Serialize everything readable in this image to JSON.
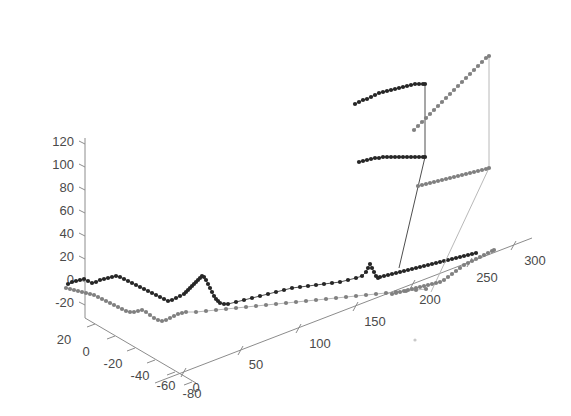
{
  "figure": {
    "title": "",
    "background_color": "#ffffff",
    "width": 571,
    "height": 416
  },
  "chart_data": {
    "type": "scatter",
    "projection": "3d",
    "title": "",
    "xlabel": "",
    "ylabel": "",
    "zlabel": "",
    "grid": false,
    "legend": null,
    "axes": {
      "x": {
        "ticks": [
          0,
          50,
          100,
          150,
          200,
          250,
          300
        ],
        "tick_labels": [
          "0",
          "50",
          "100",
          "150",
          "200",
          "250",
          "300"
        ],
        "range": [
          -20,
          320
        ]
      },
      "y": {
        "ticks": [
          20,
          0,
          -20,
          -40,
          -60,
          -80
        ],
        "tick_labels": [
          "20",
          "0",
          "-20",
          "-40",
          "-60",
          "-80"
        ],
        "range": [
          30,
          -95
        ]
      },
      "z": {
        "ticks": [
          -20,
          0,
          20,
          40,
          60,
          80,
          100,
          120
        ],
        "tick_labels": [
          "-20",
          "0",
          "20",
          "40",
          "60",
          "80",
          "100",
          "120"
        ],
        "range": [
          -30,
          130
        ]
      }
    },
    "series": [
      {
        "name": "dark-trajectory",
        "color": "#262626",
        "line_color": "#3a3a3a",
        "marker": "circle",
        "points_px": [
          [
            68,
            284
          ],
          [
            72,
            282
          ],
          [
            76,
            281
          ],
          [
            80,
            280
          ],
          [
            84,
            279
          ],
          [
            88,
            281
          ],
          [
            92,
            283
          ],
          [
            96,
            282
          ],
          [
            100,
            280
          ],
          [
            104,
            279
          ],
          [
            108,
            278
          ],
          [
            112,
            277
          ],
          [
            116,
            276
          ],
          [
            120,
            277
          ],
          [
            124,
            279
          ],
          [
            128,
            281
          ],
          [
            132,
            283
          ],
          [
            136,
            285
          ],
          [
            140,
            287
          ],
          [
            144,
            289
          ],
          [
            148,
            291
          ],
          [
            152,
            293
          ],
          [
            156,
            295
          ],
          [
            160,
            297
          ],
          [
            164,
            299
          ],
          [
            168,
            301
          ],
          [
            172,
            300
          ],
          [
            176,
            298
          ],
          [
            180,
            296
          ],
          [
            184,
            294
          ],
          [
            186,
            292
          ],
          [
            188,
            290
          ],
          [
            190,
            288
          ],
          [
            192,
            286
          ],
          [
            194,
            284
          ],
          [
            196,
            282
          ],
          [
            198,
            280
          ],
          [
            200,
            278
          ],
          [
            202,
            276
          ],
          [
            204,
            277
          ],
          [
            206,
            280
          ],
          [
            208,
            284
          ],
          [
            210,
            288
          ],
          [
            212,
            292
          ],
          [
            214,
            296
          ],
          [
            216,
            299
          ],
          [
            218,
            301
          ],
          [
            220,
            303
          ],
          [
            224,
            304
          ],
          [
            228,
            304
          ],
          [
            236,
            302
          ],
          [
            244,
            300
          ],
          [
            252,
            298
          ],
          [
            260,
            296
          ],
          [
            268,
            294
          ],
          [
            276,
            292
          ],
          [
            284,
            290
          ],
          [
            292,
            288
          ],
          [
            300,
            287
          ],
          [
            308,
            286
          ],
          [
            316,
            285
          ],
          [
            324,
            284
          ],
          [
            332,
            283
          ],
          [
            340,
            282
          ],
          [
            348,
            280
          ],
          [
            356,
            278
          ],
          [
            362,
            276
          ],
          [
            366,
            272
          ],
          [
            368,
            268
          ],
          [
            370,
            264
          ],
          [
            372,
            268
          ],
          [
            374,
            272
          ],
          [
            376,
            276
          ],
          [
            378,
            278
          ],
          [
            380,
            277
          ],
          [
            384,
            276
          ],
          [
            388,
            275
          ],
          [
            392,
            274
          ],
          [
            396,
            273
          ],
          [
            400,
            272
          ],
          [
            404,
            271
          ],
          [
            408,
            270
          ],
          [
            412,
            269
          ],
          [
            416,
            268
          ],
          [
            420,
            267
          ],
          [
            424,
            266
          ],
          [
            428,
            265
          ],
          [
            432,
            264
          ],
          [
            436,
            263
          ],
          [
            440,
            262
          ],
          [
            444,
            261
          ],
          [
            448,
            260
          ],
          [
            452,
            259
          ],
          [
            456,
            258
          ],
          [
            460,
            257
          ],
          [
            464,
            256
          ],
          [
            468,
            255
          ],
          [
            472,
            254
          ],
          [
            476,
            253
          ]
        ],
        "upper_points_px": [
          [
            359,
            162
          ],
          [
            363,
            161
          ],
          [
            367,
            160
          ],
          [
            371,
            159
          ],
          [
            375,
            158
          ],
          [
            379,
            158
          ],
          [
            383,
            157
          ],
          [
            387,
            157
          ],
          [
            391,
            157
          ],
          [
            395,
            157
          ],
          [
            399,
            157
          ],
          [
            403,
            157
          ],
          [
            407,
            157
          ],
          [
            411,
            157
          ],
          [
            415,
            157
          ],
          [
            419,
            157
          ],
          [
            423,
            157
          ],
          [
            425,
            157
          ],
          [
            355,
            104
          ],
          [
            359,
            102
          ],
          [
            363,
            100
          ],
          [
            367,
            99
          ],
          [
            371,
            97
          ],
          [
            375,
            95
          ],
          [
            379,
            93
          ],
          [
            383,
            92
          ],
          [
            387,
            91
          ],
          [
            391,
            90
          ],
          [
            395,
            89
          ],
          [
            399,
            88
          ],
          [
            403,
            87
          ],
          [
            407,
            86
          ],
          [
            411,
            85
          ],
          [
            415,
            84
          ],
          [
            419,
            84
          ],
          [
            423,
            84
          ],
          [
            425,
            84
          ]
        ],
        "risers_px": [
          [
            425,
            157
          ],
          [
            425,
            84
          ]
        ],
        "descent_px": [
          [
            425,
            157
          ],
          [
            399,
            268
          ]
        ]
      },
      {
        "name": "light-trajectory",
        "color": "#808080",
        "line_color": "#b0b0b0",
        "marker": "circle",
        "points_px": [
          [
            66,
            288
          ],
          [
            70,
            289
          ],
          [
            74,
            290
          ],
          [
            78,
            291
          ],
          [
            82,
            292
          ],
          [
            86,
            293
          ],
          [
            90,
            294
          ],
          [
            94,
            295
          ],
          [
            98,
            297
          ],
          [
            102,
            299
          ],
          [
            106,
            301
          ],
          [
            110,
            303
          ],
          [
            114,
            305
          ],
          [
            118,
            307
          ],
          [
            122,
            309
          ],
          [
            126,
            311
          ],
          [
            130,
            312
          ],
          [
            134,
            312
          ],
          [
            138,
            311
          ],
          [
            142,
            310
          ],
          [
            146,
            312
          ],
          [
            150,
            315
          ],
          [
            154,
            318
          ],
          [
            158,
            320
          ],
          [
            162,
            321
          ],
          [
            166,
            320
          ],
          [
            170,
            318
          ],
          [
            174,
            316
          ],
          [
            178,
            314
          ],
          [
            182,
            313
          ],
          [
            186,
            312
          ],
          [
            196,
            312
          ],
          [
            206,
            311
          ],
          [
            216,
            310
          ],
          [
            226,
            309
          ],
          [
            236,
            308
          ],
          [
            246,
            307
          ],
          [
            256,
            306
          ],
          [
            266,
            305
          ],
          [
            276,
            304
          ],
          [
            286,
            303
          ],
          [
            296,
            302
          ],
          [
            306,
            301
          ],
          [
            316,
            300
          ],
          [
            326,
            299
          ],
          [
            336,
            298
          ],
          [
            346,
            297
          ],
          [
            356,
            296
          ],
          [
            366,
            295
          ],
          [
            376,
            294
          ],
          [
            386,
            293
          ],
          [
            396,
            292
          ],
          [
            406,
            291
          ],
          [
            416,
            290
          ],
          [
            426,
            289
          ]
        ],
        "mid_points_px": [
          [
            392,
            294
          ],
          [
            396,
            293
          ],
          [
            400,
            292
          ],
          [
            404,
            291
          ],
          [
            408,
            290
          ],
          [
            412,
            289
          ],
          [
            416,
            288
          ],
          [
            420,
            287
          ],
          [
            424,
            286
          ],
          [
            428,
            285
          ],
          [
            432,
            284
          ],
          [
            436,
            283
          ],
          [
            440,
            282
          ],
          [
            444,
            280
          ],
          [
            448,
            277
          ],
          [
            452,
            274
          ],
          [
            456,
            271
          ],
          [
            460,
            268
          ],
          [
            464,
            265
          ],
          [
            468,
            263
          ],
          [
            472,
            261
          ],
          [
            476,
            259
          ],
          [
            480,
            257
          ],
          [
            484,
            255
          ],
          [
            488,
            253
          ],
          [
            492,
            251
          ],
          [
            494,
            250
          ]
        ],
        "upper_points_px": [
          [
            418,
            186
          ],
          [
            422,
            185
          ],
          [
            426,
            184
          ],
          [
            430,
            183
          ],
          [
            434,
            182
          ],
          [
            438,
            181
          ],
          [
            442,
            180
          ],
          [
            446,
            179
          ],
          [
            450,
            178
          ],
          [
            454,
            177
          ],
          [
            458,
            176
          ],
          [
            462,
            175
          ],
          [
            466,
            174
          ],
          [
            470,
            173
          ],
          [
            474,
            172
          ],
          [
            478,
            171
          ],
          [
            482,
            170
          ],
          [
            486,
            169
          ],
          [
            489,
            168
          ],
          [
            414,
            130
          ],
          [
            418,
            126
          ],
          [
            422,
            122
          ],
          [
            426,
            118
          ],
          [
            430,
            114
          ],
          [
            434,
            110
          ],
          [
            438,
            106
          ],
          [
            442,
            102
          ],
          [
            446,
            98
          ],
          [
            450,
            94
          ],
          [
            454,
            90
          ],
          [
            458,
            86
          ],
          [
            462,
            82
          ],
          [
            466,
            78
          ],
          [
            470,
            74
          ],
          [
            474,
            70
          ],
          [
            478,
            66
          ],
          [
            482,
            62
          ],
          [
            486,
            58
          ],
          [
            489,
            56
          ]
        ],
        "risers_px": [
          [
            489,
            168
          ],
          [
            489,
            56
          ]
        ],
        "descent_px": [
          [
            489,
            168
          ],
          [
            431,
            292
          ]
        ]
      }
    ],
    "annotations": [
      {
        "name": "isolated-faint-marker",
        "x_px": 415,
        "y_px": 340,
        "color": "#d0d0d0"
      }
    ]
  }
}
